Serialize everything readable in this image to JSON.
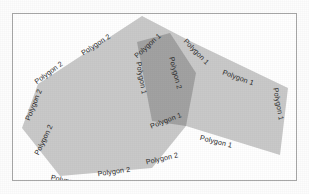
{
  "figure": {
    "background_color": "#fdfdfd",
    "frame": {
      "border_color": "#a8a8a8",
      "fill_color": "#ffffff"
    }
  },
  "chart_data": {
    "type": "map",
    "title": "",
    "xlabel": "",
    "ylabel": "",
    "grid": false,
    "legend_position": "none",
    "colors": {
      "polygon_fill": "#c9c9c9",
      "overlap_fill": "#a2a2a2",
      "label_text": "#2b2b2b",
      "frame_border": "#a8a8a8"
    },
    "shapes": [
      {
        "name": "Polygon 1",
        "label": "Polygon 1",
        "fill": "#c9c9c9",
        "vertices": [
          [
            142,
            16
          ],
          [
            190,
            41
          ],
          [
            288,
            88
          ],
          [
            280,
            155
          ],
          [
            186,
            126
          ],
          [
            152,
            121
          ],
          [
            137,
            42
          ]
        ]
      },
      {
        "name": "Polygon 2",
        "label": "Polygon 2",
        "fill": "#c9c9c9",
        "vertices": [
          [
            142,
            16
          ],
          [
            196,
            73
          ],
          [
            186,
            126
          ],
          [
            152,
            168
          ],
          [
            60,
            176
          ],
          [
            22,
            128
          ],
          [
            38,
            84
          ]
        ]
      },
      {
        "name": "Overlap region",
        "label": "",
        "fill": "#a2a2a2",
        "vertices": [
          [
            170,
            33
          ],
          [
            196,
            73
          ],
          [
            186,
            126
          ],
          [
            152,
            121
          ],
          [
            137,
            42
          ]
        ]
      }
    ],
    "labels": [
      {
        "text": "Polygon 2",
        "x": 44,
        "y": 140,
        "rotation": -64
      },
      {
        "text": "Polygon 2",
        "x": 34,
        "y": 105,
        "rotation": -68
      },
      {
        "text": "Polygon 2",
        "x": 49,
        "y": 73,
        "rotation": -36
      },
      {
        "text": "Polygon 2",
        "x": 96,
        "y": 45,
        "rotation": -33
      },
      {
        "text": "Polygon 2",
        "x": 67,
        "y": 181,
        "rotation": 12
      },
      {
        "text": "Polygon 2",
        "x": 114,
        "y": 172,
        "rotation": -8
      },
      {
        "text": "Polygon 2",
        "x": 162,
        "y": 159,
        "rotation": -13
      },
      {
        "text": "Polygon 1",
        "x": 148,
        "y": 46,
        "rotation": -42
      },
      {
        "text": "Polygon 1",
        "x": 141,
        "y": 78,
        "rotation": 80
      },
      {
        "text": "Polygon 2",
        "x": 175,
        "y": 73,
        "rotation": 76
      },
      {
        "text": "Polygon 1",
        "x": 196,
        "y": 52,
        "rotation": 46
      },
      {
        "text": "Polygon 1",
        "x": 238,
        "y": 78,
        "rotation": 20
      },
      {
        "text": "Polygon 1",
        "x": 278,
        "y": 104,
        "rotation": 80
      },
      {
        "text": "Polygon 1",
        "x": 166,
        "y": 121,
        "rotation": -21
      },
      {
        "text": "Polygon 1",
        "x": 216,
        "y": 142,
        "rotation": 14
      }
    ]
  }
}
